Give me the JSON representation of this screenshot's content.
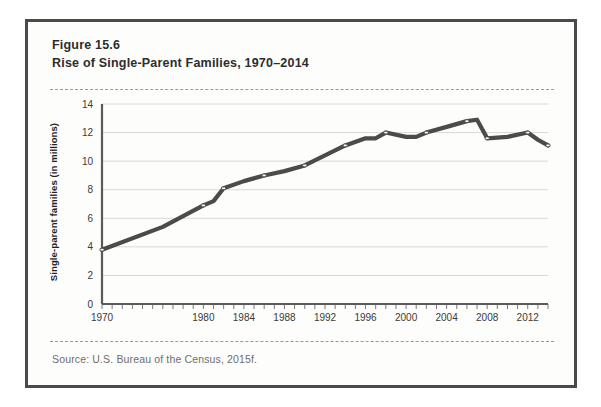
{
  "figure": {
    "number": "Figure 15.6",
    "title": "Rise of Single-Parent Families, 1970–2014",
    "source": "Source: U.S. Bureau of the Census, 2015f."
  },
  "colors": {
    "frame_border": "#4a4a4a",
    "line": "#4b4b4b",
    "grid": "#d8d8d8",
    "axis": "#5a5a5a",
    "title_text": "#2d2d2d",
    "source_text": "#6e6e6e"
  },
  "chart_data": {
    "type": "line",
    "title": "Rise of Single-Parent Families, 1970–2014",
    "xlabel": "",
    "ylabel": "Single-parent families (in millions)",
    "xlim": [
      1970,
      2014
    ],
    "ylim": [
      0,
      14
    ],
    "yticks": [
      0,
      2,
      4,
      6,
      8,
      10,
      12,
      14
    ],
    "ytick_labels": [
      "0",
      "2",
      "4",
      "6",
      "8",
      "10",
      "12",
      "14"
    ],
    "xticks": [
      1970,
      1980,
      1984,
      1988,
      1992,
      1996,
      2000,
      2004,
      2008,
      2012
    ],
    "xtick_labels": [
      "1970",
      "1980",
      "1984",
      "1988",
      "1992",
      "1996",
      "2000",
      "2004",
      "2008",
      "2012"
    ],
    "x_minor_tick_interval": 1,
    "grid": "horizontal",
    "legend": "none",
    "x": [
      1970,
      1976,
      1980,
      1981,
      1982,
      1984,
      1986,
      1988,
      1990,
      1992,
      1994,
      1996,
      1997,
      1998,
      2000,
      2001,
      2002,
      2004,
      2006,
      2007,
      2008,
      2010,
      2012,
      2013,
      2014
    ],
    "values": [
      3.8,
      5.4,
      6.9,
      7.2,
      8.1,
      8.6,
      9.0,
      9.3,
      9.7,
      10.4,
      11.1,
      11.6,
      11.6,
      12.0,
      11.7,
      11.7,
      12.0,
      12.4,
      12.8,
      12.9,
      11.6,
      11.7,
      12.0,
      11.5,
      11.1
    ],
    "series": [
      {
        "name": "Single-parent families",
        "values": [
          3.8,
          5.4,
          6.9,
          7.2,
          8.1,
          8.6,
          9.0,
          9.3,
          9.7,
          10.4,
          11.1,
          11.6,
          11.6,
          12.0,
          11.7,
          11.7,
          12.0,
          12.4,
          12.8,
          12.9,
          11.6,
          11.7,
          12.0,
          11.5,
          11.1
        ]
      }
    ],
    "markers": [
      1970,
      1980,
      1982,
      1986,
      1990,
      1994,
      1998,
      2002,
      2006,
      2008,
      2012,
      2014
    ]
  }
}
